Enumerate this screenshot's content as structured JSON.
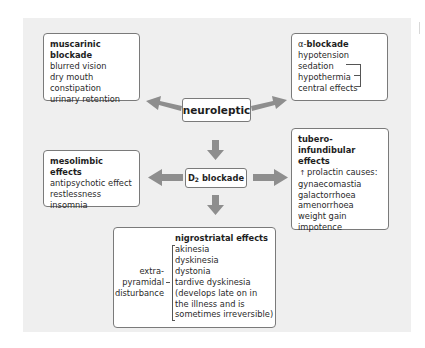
{
  "diagram": {
    "center": {
      "label": "neuroleptic"
    },
    "d2": {
      "label": "D",
      "subscript": "2",
      "suffix": " blockade"
    },
    "muscarinic": {
      "title": "muscarinic blockade",
      "items": [
        "blurred vision",
        "dry mouth",
        "constipation",
        "urinary retention"
      ]
    },
    "alpha": {
      "title_prefix": "α-",
      "title": "blockade",
      "items": [
        "hypotension",
        "sedation",
        "hypothermia",
        "central effects"
      ]
    },
    "mesolimbic": {
      "title": "mesolimbic effects",
      "items": [
        "antipsychotic effect",
        "restlessness",
        "insomnia"
      ]
    },
    "tubero": {
      "title_line1": "tubero-infundibular",
      "title_line2": "effects",
      "arrow_glyph": "↑",
      "lead": "prolactin causes:",
      "items": [
        "gynaecomastia",
        "galactorrhoea",
        "amenorrhoea",
        "weight gain",
        "impotence"
      ]
    },
    "nigrostriatal": {
      "title": "nigrostriatal effects",
      "side_label": [
        "extra-",
        "pyramidal",
        "disturbance"
      ],
      "items": [
        "akinesia",
        "dyskinesia",
        "dystonia",
        "tardive dyskinesia",
        "(develops late on in",
        "the illness and is",
        "sometimes irreversible)"
      ]
    },
    "colors": {
      "arrow": "#8e8e8e",
      "panel": "#efefef",
      "border": "#7a7a7a"
    }
  }
}
